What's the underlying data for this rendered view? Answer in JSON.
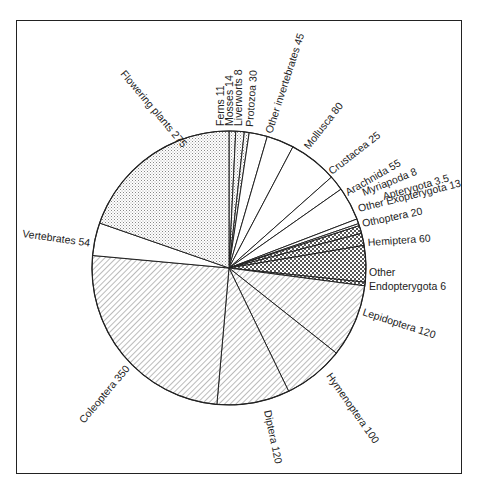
{
  "chart_data": {
    "type": "pie",
    "title": "",
    "start_angle_deg": 0,
    "direction": "clockwise",
    "total": 1397.5,
    "slices": [
      {
        "label": "Ferns",
        "value": 11,
        "fill": "stipple"
      },
      {
        "label": "Mosses",
        "value": 14,
        "fill": "stipple"
      },
      {
        "label": "Liverworts",
        "value": 8,
        "fill": "stipple"
      },
      {
        "label": "Protozoa",
        "value": 30,
        "fill": "white"
      },
      {
        "label": "Other invertebrates",
        "value": 45,
        "fill": "white"
      },
      {
        "label": "Mollusca",
        "value": 80,
        "fill": "white"
      },
      {
        "label": "Crustacea",
        "value": 25,
        "fill": "white"
      },
      {
        "label": "Arachnida",
        "value": 55,
        "fill": "white"
      },
      {
        "label": "Myriapoda",
        "value": 8,
        "fill": "white"
      },
      {
        "label": "Apterygota",
        "value": 3.5,
        "fill": "white"
      },
      {
        "label": "Other Exopterygota",
        "value": 13,
        "fill": "check"
      },
      {
        "label": "Othoptera",
        "value": 20,
        "fill": "check"
      },
      {
        "label": "Hemiptera",
        "value": 60,
        "fill": "check"
      },
      {
        "label": "Other Endopterygota",
        "value": 6,
        "fill": "check"
      },
      {
        "label": "Lepidoptera",
        "value": 120,
        "fill": "hatch"
      },
      {
        "label": "Hymenoptera",
        "value": 100,
        "fill": "hatch"
      },
      {
        "label": "Diptera",
        "value": 120,
        "fill": "hatch"
      },
      {
        "label": "Coleoptera",
        "value": 350,
        "fill": "hatch"
      },
      {
        "label": "Vertebrates",
        "value": 54,
        "fill": "white"
      },
      {
        "label": "Flowering plants",
        "value": 275,
        "fill": "stipple"
      }
    ],
    "legend": "none (labels placed around the pie)",
    "colors": {
      "line": "#222222",
      "background": "#ffffff"
    }
  },
  "labels": {
    "ferns": "Ferns 11",
    "mosses": "Mosses 14",
    "liverworts": "Liverworts 8",
    "protozoa": "Protozoa 30",
    "other_invertebrates": "Other invertebrates 45",
    "mollusca": "Mollusca 80",
    "crustacea": "Crustacea 25",
    "arachnida": "Arachnida 55",
    "myriapoda": "Myriapoda 8",
    "apterygota": "Apterygota 3.5",
    "other_exopterygota": "Other Exopterygota 13",
    "othoptera": "Othoptera 20",
    "hemiptera": "Hemiptera 60",
    "other_endopterygota_1": "Other",
    "other_endopterygota_2": "Endopterygota 6",
    "lepidoptera": "Lepidoptera 120",
    "hymenoptera": "Hymenoptera 100",
    "diptera": "Diptera 120",
    "coleoptera": "Coleoptera 350",
    "vertebrates": "Vertebrates 54",
    "flowering_plants": "Flowering plants 275"
  }
}
